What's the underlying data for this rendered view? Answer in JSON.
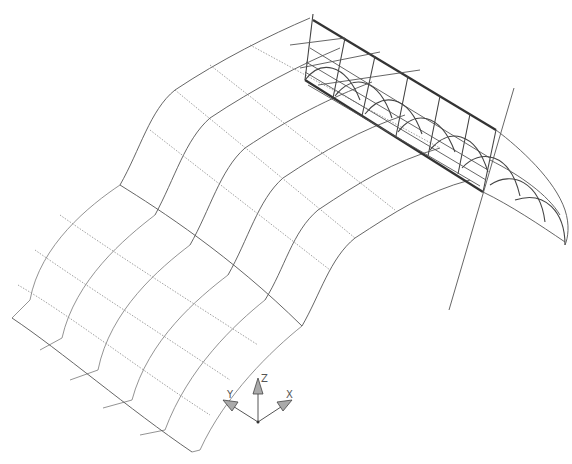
{
  "drawing": {
    "view": "isometric wireframe",
    "background": "#ffffff",
    "line_color": "#555555"
  },
  "ucs_icon": {
    "labels": {
      "x": "X",
      "y": "Y",
      "z": "Z"
    },
    "origin": [
      258,
      422
    ]
  },
  "geometry": {
    "upper_surface_curves": [
      "M120,185 C140,150 150,110 175,90 C220,60 270,35 310,18",
      "M155,215 C175,178 185,140 210,118 C255,88 300,65 340,48",
      "M190,245 C210,210 220,170 245,148 C290,118 330,98 372,82",
      "M228,275 C248,240 258,200 283,178 C325,150 360,130 405,115",
      "M265,300 C285,268 292,232 318,210 C360,182 392,162 440,148",
      "M302,326 C320,295 330,258 355,238 C395,212 425,192 470,180"
    ],
    "upper_cross_lines": [
      "M175,90 L355,238",
      "M205,70 L395,212",
      "M155,117 L335,265"
    ],
    "lower_surface_curves": [
      "M120,185 C90,215 40,250 30,300 L12,315",
      "M155,215 C125,240 70,280 60,335 L42,345",
      "M190,245 C160,270 100,310 88,365 L75,375",
      "M228,275 C198,298 135,340 125,395 L110,405",
      "M265,300 C235,325 170,370 160,425 L148,435",
      "M302,326 C272,350 210,395 198,450 L192,452"
    ],
    "lower_cross_lines": [
      "M12,315 L192,452",
      "M20,290 L200,430",
      "M30,262 L215,400",
      "M48,230 L240,368",
      "M75,205 L272,344"
    ],
    "box_thick": [
      "M313,20 L496,130",
      "M305,80 L483,192"
    ],
    "box_thin": [
      "M313,20 L305,80",
      "M496,130 L483,192",
      "M345,38 L333,98",
      "M375,56 L362,116",
      "M408,76 L396,136",
      "M440,96 L428,156",
      "M470,114 L458,174",
      "M310,50 L490,160",
      "M300,60 L488,172",
      "M303,70 L485,182",
      "M340,28 L308,70",
      "M370,46 L335,88",
      "M402,66 L365,108"
    ],
    "arches": [
      "M305,80 C320,55 345,58 355,95",
      "M335,95 C350,70 375,72 388,112",
      "M365,112 C380,88 405,90 420,130",
      "M398,130 C412,106 438,108 452,150",
      "M430,150 C445,126 470,128 485,170",
      "M460,168 C478,145 505,150 518,195",
      "M485,190 C510,175 545,190 548,222",
      "M520,210 C548,200 568,220 565,245"
    ],
    "small_arch_edges": [
      "M483,192 L565,240",
      "M485,190 C505,210 540,225 568,245",
      "M496,130 C520,150 550,175 565,205"
    ],
    "long_line": "M514,88 L449,310"
  }
}
